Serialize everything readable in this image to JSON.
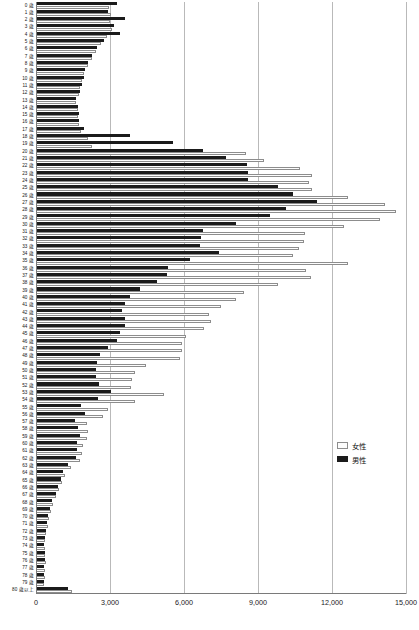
{
  "chart_data": {
    "type": "bar",
    "orientation": "horizontal",
    "title": "",
    "subtitle": "",
    "xlabel": "",
    "ylabel": "",
    "xlim": [
      0,
      15000
    ],
    "xticks": [
      0,
      3000,
      6000,
      9000,
      12000,
      15000
    ],
    "xticklabels": [
      "0",
      "3,000",
      "6,000",
      "9,000",
      "12,000",
      "15,000"
    ],
    "grid": true,
    "grid_axis": "x",
    "legend": {
      "position": "right-middle",
      "entries": [
        {
          "name": "女性",
          "color": "#fdfdfd",
          "edgecolor": "#8d8d8d"
        },
        {
          "name": "男性",
          "color": "#1b1b1b",
          "edgecolor": "#1b1b1b"
        }
      ]
    },
    "categories": [
      "0 歳",
      "1 歳",
      "2 歳",
      "3 歳",
      "4 歳",
      "5 歳",
      "6 歳",
      "7 歳",
      "8 歳",
      "9 歳",
      "10 歳",
      "11 歳",
      "12 歳",
      "13 歳",
      "14 歳",
      "15 歳",
      "16 歳",
      "17 歳",
      "18 歳",
      "19 歳",
      "20 歳",
      "21 歳",
      "22 歳",
      "23 歳",
      "24 歳",
      "25 歳",
      "26 歳",
      "27 歳",
      "28 歳",
      "29 歳",
      "30 歳",
      "31 歳",
      "32 歳",
      "33 歳",
      "34 歳",
      "35 歳",
      "36 歳",
      "37 歳",
      "38 歳",
      "39 歳",
      "40 歳",
      "41 歳",
      "42 歳",
      "43 歳",
      "44 歳",
      "45 歳",
      "46 歳",
      "47 歳",
      "48 歳",
      "49 歳",
      "50 歳",
      "51 歳",
      "52 歳",
      "53 歳",
      "54 歳",
      "55 歳",
      "56 歳",
      "57 歳",
      "58 歳",
      "59 歳",
      "60 歳",
      "61 歳",
      "62 歳",
      "63 歳",
      "64 歳",
      "65 歳",
      "66 歳",
      "67 歳",
      "68 歳",
      "69 歳",
      "70 歳",
      "71 歳",
      "72 歳",
      "73 歳",
      "74 歳",
      "75 歳",
      "76 歳",
      "77 歳",
      "78 歳",
      "79 歳",
      "80 歳以上"
    ],
    "series": [
      {
        "name": "男性",
        "color": "#1b1b1b",
        "values": [
          3300,
          2900,
          3620,
          3170,
          3400,
          2750,
          2480,
          2260,
          2100,
          1980,
          1930,
          1850,
          1800,
          1640,
          1720,
          1730,
          1760,
          1930,
          3820,
          5550,
          6750,
          7700,
          8550,
          8600,
          8600,
          9800,
          10400,
          11400,
          10150,
          9500,
          8100,
          6750,
          6700,
          6650,
          7400,
          6250,
          5350,
          5330,
          4900,
          4220,
          3800,
          3600,
          3500,
          3600,
          3600,
          3400,
          3300,
          2900,
          2580,
          2460,
          2450,
          2450,
          2570,
          3050,
          2520,
          1820,
          1980,
          1570,
          1720,
          1800,
          1680,
          1650,
          1620,
          1280,
          1080,
          1000,
          880,
          800,
          640,
          560,
          500,
          440,
          400,
          360,
          340,
          360,
          380,
          340,
          340,
          320,
          1300
        ]
      },
      {
        "name": "女性",
        "color": "#fdfdfd",
        "edgecolor": "#8d8d8d",
        "values": [
          2970,
          3060,
          3020,
          3080,
          2880,
          2620,
          2430,
          2260,
          2100,
          1960,
          1880,
          1800,
          1740,
          1620,
          1700,
          1700,
          1760,
          1830,
          2100,
          2280,
          8500,
          9250,
          10700,
          11200,
          11050,
          11200,
          12650,
          14150,
          14600,
          13950,
          12500,
          10900,
          10850,
          10650,
          10400,
          12650,
          10950,
          11150,
          9800,
          8450,
          8100,
          7500,
          7000,
          7100,
          6800,
          6100,
          5900,
          5900,
          5850,
          4450,
          4000,
          3900,
          3850,
          5200,
          4000,
          2900,
          2700,
          2050,
          2100,
          2050,
          1900,
          1880,
          1800,
          1400,
          1180,
          1060,
          920,
          830,
          700,
          600,
          540,
          470,
          420,
          380,
          360,
          380,
          400,
          360,
          360,
          340,
          1450
        ]
      }
    ]
  }
}
